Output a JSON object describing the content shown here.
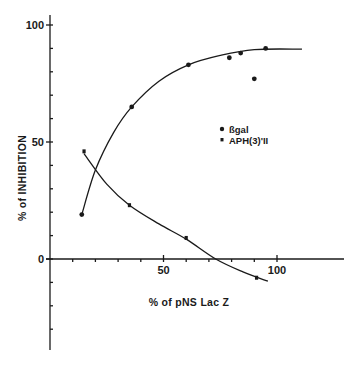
{
  "chart_data": {
    "type": "scatter",
    "title": "",
    "xlabel": "% of pNS Lac Z",
    "ylabel": "% of INHIBITION",
    "xlim": [
      0,
      115
    ],
    "ylim": [
      -40,
      105
    ],
    "grid": false,
    "legend_position": "inside-right-middle",
    "x_ticks": [
      0,
      10,
      20,
      30,
      40,
      50,
      60,
      70,
      80,
      90,
      100
    ],
    "x_tick_labels": [
      "50",
      "100"
    ],
    "y_ticks": [
      -30,
      -20,
      -10,
      0,
      10,
      20,
      30,
      40,
      50,
      60,
      70,
      80,
      90,
      100
    ],
    "y_tick_labels": [
      "0",
      "50",
      "100"
    ],
    "series": [
      {
        "name": "ßgal",
        "marker": "circle",
        "points": [
          {
            "x": 14,
            "y": 19
          },
          {
            "x": 36,
            "y": 65
          },
          {
            "x": 61,
            "y": 83
          },
          {
            "x": 79,
            "y": 86
          },
          {
            "x": 84,
            "y": 88
          },
          {
            "x": 90,
            "y": 77
          },
          {
            "x": 95,
            "y": 90
          }
        ],
        "fit_curve": [
          [
            14,
            19
          ],
          [
            20,
            38
          ],
          [
            28,
            54
          ],
          [
            36,
            65
          ],
          [
            48,
            76
          ],
          [
            61,
            83
          ],
          [
            75,
            87
          ],
          [
            90,
            89.5
          ],
          [
            111,
            89.7
          ]
        ]
      },
      {
        "name": "APH(3)'II",
        "marker": "square",
        "points": [
          {
            "x": 15,
            "y": 46
          },
          {
            "x": 35,
            "y": 23
          },
          {
            "x": 60,
            "y": 9
          },
          {
            "x": 91,
            "y": -8
          }
        ],
        "fit_curve": [
          [
            15,
            45
          ],
          [
            25,
            32
          ],
          [
            35,
            23
          ],
          [
            48,
            15
          ],
          [
            60,
            8.5
          ],
          [
            73,
            0
          ],
          [
            85,
            -5.5
          ],
          [
            96,
            -9.5
          ]
        ]
      }
    ]
  },
  "axes": {
    "x": {
      "label": "% of pNS Lac Z",
      "ticks": [
        {
          "value": 50,
          "label": "50"
        },
        {
          "value": 100,
          "label": "100"
        }
      ]
    },
    "y": {
      "label": "% of INHIBITION",
      "ticks": [
        {
          "value": 0,
          "label": "0"
        },
        {
          "value": 50,
          "label": "50"
        },
        {
          "value": 100,
          "label": "100"
        }
      ]
    }
  },
  "legend": {
    "items": [
      {
        "label": "ßgal",
        "marker": "circle"
      },
      {
        "label": "APH(3)'II",
        "marker": "square"
      }
    ]
  },
  "colors": {
    "ink": "#1a1a1a",
    "background": "#ffffff"
  }
}
